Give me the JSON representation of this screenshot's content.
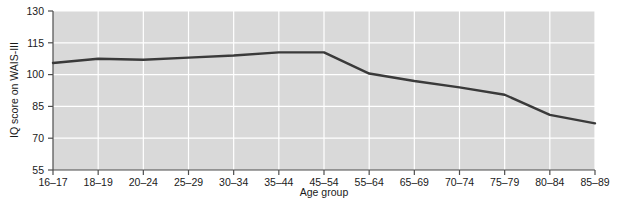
{
  "chart_data": {
    "type": "line",
    "title": "",
    "xlabel": "Age group",
    "ylabel": "IQ score on WAIS-III",
    "categories": [
      "16–17",
      "18–19",
      "20–24",
      "25–29",
      "30–34",
      "35–44",
      "45–54",
      "55–64",
      "65–69",
      "70–74",
      "75–79",
      "80–84",
      "85–89"
    ],
    "values": [
      105.5,
      107.5,
      107,
      108,
      109,
      110.5,
      110.5,
      100.5,
      97,
      94,
      90.5,
      81,
      77
    ],
    "series": [
      {
        "name": "IQ score on WAIS-III",
        "values": [
          105.5,
          107.5,
          107,
          108,
          109,
          110.5,
          110.5,
          100.5,
          97,
          94,
          90.5,
          81,
          77
        ]
      }
    ],
    "ylim": [
      55,
      130
    ],
    "yticks": [
      55,
      70,
      85,
      100,
      115,
      130
    ],
    "ytick_labels": [
      "55",
      "70",
      "85",
      "100",
      "115",
      "130"
    ],
    "grid": true,
    "legend": "none",
    "plot_background": "#d9d9d9",
    "grid_color": "#ffffff",
    "line_color": "#3a3a3a",
    "axis_color": "#4d4d4d"
  }
}
